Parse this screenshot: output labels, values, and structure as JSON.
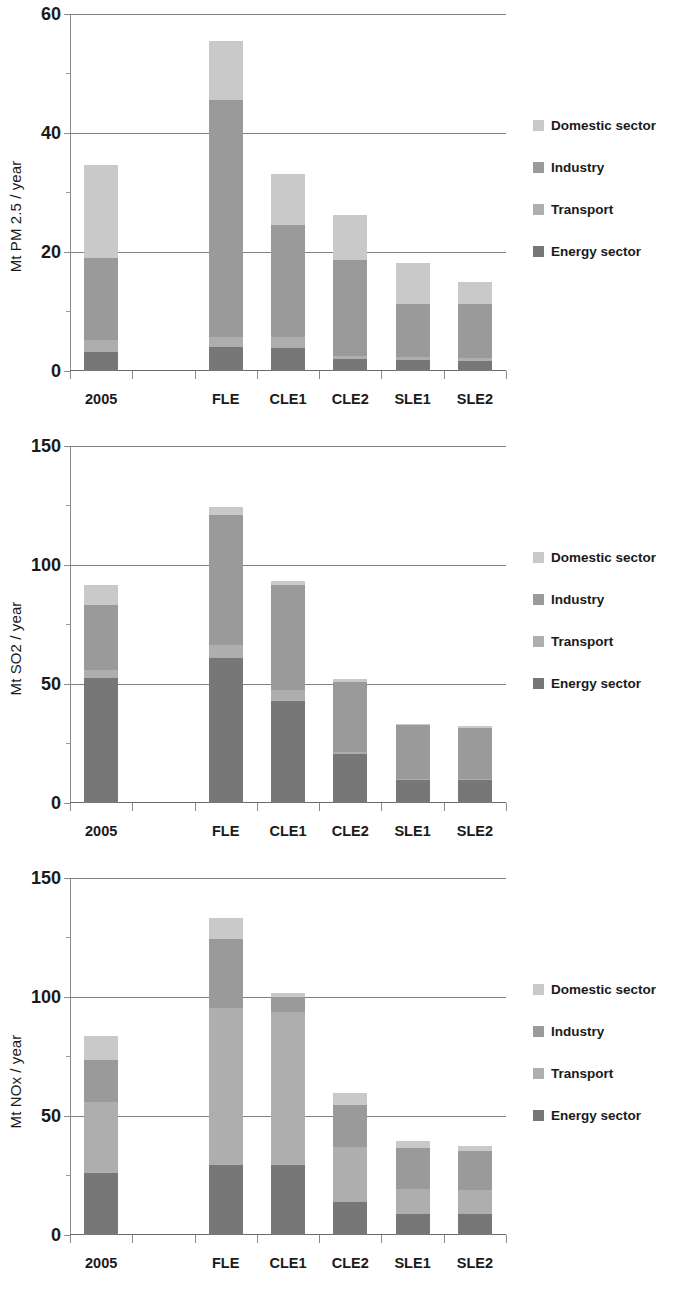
{
  "figure": {
    "background": "#ffffff",
    "panel_count": 3
  },
  "legend": {
    "position": "right",
    "entries": [
      {
        "label": "Domestic sector",
        "color": "#c9c9c9",
        "key": "domestic"
      },
      {
        "label": "Industry",
        "color": "#9a9a9a",
        "key": "industry"
      },
      {
        "label": "Transport",
        "color": "#aeaeae",
        "key": "transport"
      },
      {
        "label": "Energy sector",
        "color": "#777777",
        "key": "energy"
      }
    ]
  },
  "colors": {
    "domestic": "#c9c9c9",
    "industry": "#9a9a9a",
    "transport": "#aeaeae",
    "energy": "#777777",
    "grid": "#808080",
    "axis": "#8c8c8c",
    "text": "#1a1a1a"
  },
  "chart_data": [
    {
      "type": "bar",
      "subtype": "stacked",
      "title": "",
      "xlabel": "",
      "ylabel": "Mt PM 2.5 / year",
      "ylim": [
        0,
        60
      ],
      "yticks": [
        0,
        20,
        40,
        60
      ],
      "ytick_labels": [
        "0",
        "20",
        "40",
        "60"
      ],
      "grid": true,
      "legend_position": "right",
      "categories": [
        "2005",
        "FLE",
        "CLE1",
        "CLE2",
        "SLE1",
        "SLE2"
      ],
      "series": [
        {
          "name": "Energy sector",
          "values": [
            3.2,
            4.0,
            3.8,
            2.0,
            1.8,
            1.7
          ]
        },
        {
          "name": "Transport",
          "values": [
            2.0,
            1.8,
            2.0,
            0.6,
            0.5,
            0.5
          ]
        },
        {
          "name": "Industry",
          "values": [
            13.8,
            39.7,
            18.7,
            16.0,
            9.0,
            9.0
          ]
        },
        {
          "name": "Domestic sector",
          "values": [
            15.7,
            10.0,
            8.7,
            7.7,
            6.8,
            3.7
          ]
        }
      ],
      "totals": [
        34.7,
        55.5,
        33.2,
        26.3,
        18.1,
        14.9
      ]
    },
    {
      "type": "bar",
      "subtype": "stacked",
      "title": "",
      "xlabel": "",
      "ylabel": "Mt SO2 / year",
      "ylim": [
        0,
        150
      ],
      "yticks": [
        0,
        50,
        100,
        150
      ],
      "ytick_labels": [
        "0",
        "50",
        "100",
        "150"
      ],
      "grid": true,
      "legend_position": "right",
      "categories": [
        "2005",
        "FLE",
        "CLE1",
        "CLE2",
        "SLE1",
        "SLE2"
      ],
      "series": [
        {
          "name": "Energy sector",
          "values": [
            52.5,
            61.0,
            43.0,
            20.5,
            9.5,
            9.5
          ]
        },
        {
          "name": "Transport",
          "values": [
            3.5,
            5.5,
            4.5,
            0.8,
            0.6,
            0.6
          ]
        },
        {
          "name": "Industry",
          "values": [
            27.0,
            54.5,
            44.0,
            29.5,
            22.5,
            21.5
          ]
        },
        {
          "name": "Domestic sector",
          "values": [
            8.5,
            3.5,
            2.0,
            1.5,
            0.8,
            0.7
          ]
        }
      ],
      "totals": [
        91.5,
        124.5,
        93.5,
        52.3,
        33.4,
        32.3
      ]
    },
    {
      "type": "bar",
      "subtype": "stacked",
      "title": "",
      "xlabel": "",
      "ylabel": "Mt NOx / year",
      "ylim": [
        0,
        150
      ],
      "yticks": [
        0,
        50,
        100,
        150
      ],
      "ytick_labels": [
        "0",
        "50",
        "100",
        "150"
      ],
      "grid": true,
      "legend_position": "right",
      "categories": [
        "2005",
        "FLE",
        "CLE1",
        "CLE2",
        "SLE1",
        "SLE2"
      ],
      "series": [
        {
          "name": "Energy sector",
          "values": [
            26.0,
            29.5,
            29.5,
            14.0,
            9.0,
            9.0
          ]
        },
        {
          "name": "Transport",
          "values": [
            30.0,
            66.0,
            64.0,
            23.0,
            10.5,
            10.0
          ]
        },
        {
          "name": "Industry",
          "values": [
            17.5,
            29.0,
            6.5,
            17.5,
            17.0,
            16.5
          ]
        },
        {
          "name": "Domestic sector",
          "values": [
            10.0,
            8.5,
            1.5,
            5.0,
            3.0,
            2.0
          ]
        }
      ],
      "totals": [
        83.5,
        133.0,
        101.5,
        59.5,
        39.5,
        37.5
      ]
    }
  ]
}
